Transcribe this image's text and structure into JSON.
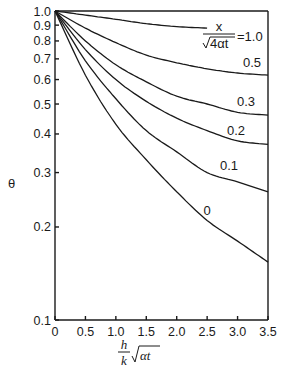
{
  "chart_data": {
    "type": "line",
    "title": "",
    "xlabel": "(h/k)·√(αt)",
    "ylabel": "θ",
    "xscale": "linear",
    "yscale": "log",
    "xlim": [
      0,
      3.5
    ],
    "ylim": [
      0.1,
      1.0
    ],
    "grid": false,
    "x_ticks": [
      "0",
      "0.5",
      "1.0",
      "1.5",
      "2.0",
      "2.5",
      "3.0",
      "3.5"
    ],
    "y_ticks": [
      "0.1",
      "0.2",
      "0.3",
      "0.4",
      "0.5",
      "0.6",
      "0.7",
      "0.8",
      "0.9",
      "1.0"
    ],
    "parameter_label": "x/√(4αt)",
    "x": [
      0,
      0.5,
      1.0,
      1.5,
      2.0,
      2.5,
      3.0,
      3.5
    ],
    "series": [
      {
        "name": "1.0",
        "label": "=1.0",
        "values": [
          1.0,
          0.97,
          0.94,
          0.91,
          0.89,
          0.88,
          null,
          null
        ]
      },
      {
        "name": "0.5",
        "label": "0.5",
        "values": [
          1.0,
          0.88,
          0.79,
          0.72,
          0.68,
          0.65,
          0.63,
          0.62
        ]
      },
      {
        "name": "0.3",
        "label": "0.3",
        "values": [
          1.0,
          0.8,
          0.67,
          0.59,
          0.53,
          0.5,
          0.47,
          0.46
        ]
      },
      {
        "name": "0.2",
        "label": "0.2",
        "values": [
          1.0,
          0.75,
          0.6,
          0.51,
          0.45,
          0.41,
          0.38,
          0.37
        ]
      },
      {
        "name": "0.1",
        "label": "0.1",
        "values": [
          1.0,
          0.69,
          0.52,
          0.41,
          0.35,
          0.3,
          0.28,
          0.26
        ]
      },
      {
        "name": "0",
        "label": "0",
        "values": [
          1.0,
          0.62,
          0.43,
          0.33,
          0.26,
          0.21,
          0.18,
          0.154
        ]
      }
    ]
  },
  "axis": {
    "y_title": "θ",
    "x_title_num": "h",
    "x_title_den": "k",
    "x_title_root": "αt",
    "param_num": "x",
    "param_den": "4αt",
    "param_eq": "=1.0"
  }
}
